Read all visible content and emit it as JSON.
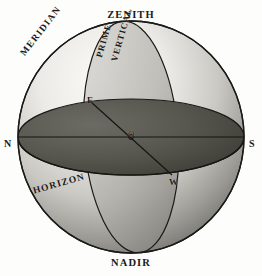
{
  "figure": {
    "background_color": "#fdfdfc",
    "line_color": "#1a1a18",
    "sphere": {
      "center_x": 131,
      "center_y": 137,
      "radius_x": 113,
      "radius_y": 116,
      "highlight_color": "#f2f1ee",
      "shadow_color": "#6d6c68"
    },
    "horizon_plane": {
      "fill_color": "#55544f",
      "semi_axis_x": 113,
      "semi_axis_y": 38
    },
    "prime_vertical_plane": {
      "fill_color": "#8e8d88",
      "semi_axis_x": 47,
      "semi_axis_y": 116,
      "tilt_degrees": -4
    }
  },
  "labels": {
    "zenith": "ZENITH",
    "nadir": "NADIR",
    "north": "N",
    "south": "S",
    "east": "E",
    "west": "W",
    "center": "O",
    "meridian": "MERIDIAN",
    "prime": "PRIME",
    "vertical": "VERTICAL",
    "horizon": "HORIZON"
  }
}
